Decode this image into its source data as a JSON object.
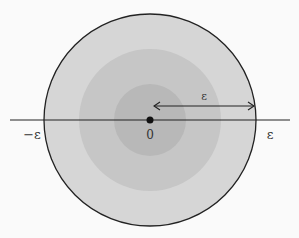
{
  "diagram": {
    "center": {
      "x": 150,
      "y": 120
    },
    "disks": [
      {
        "name": "outer",
        "radius": 106,
        "fill": "#d6d6d6",
        "stroke": "#222222"
      },
      {
        "name": "middle",
        "radius": 71,
        "fill": "#c6c6c6"
      },
      {
        "name": "inner",
        "radius": 36,
        "fill": "#b8b8b8"
      }
    ],
    "axis": {
      "x1": 10,
      "x2": 290,
      "y": 120,
      "color": "#222222"
    },
    "labels": {
      "origin": "0",
      "neg_eps": "−ε",
      "pos_eps": "ε",
      "radius": "ε"
    },
    "colors": {
      "background": "#fafafa",
      "ink": "#222222"
    }
  }
}
